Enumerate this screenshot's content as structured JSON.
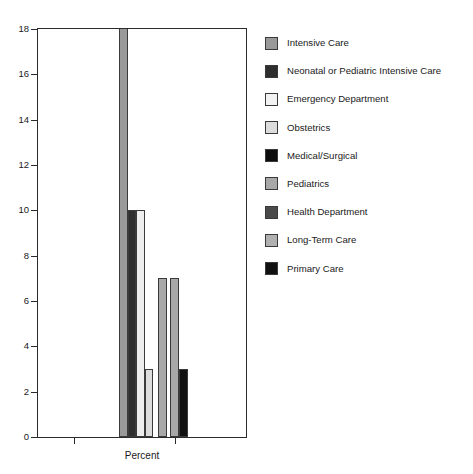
{
  "chart_data": {
    "type": "bar",
    "title": "",
    "subtitle": "",
    "xlabel": "Percent",
    "ylabel": "",
    "categories": [
      "Percent"
    ],
    "grid": false,
    "legend_position": "right",
    "ylim": [
      0,
      18
    ],
    "yticks": [
      0,
      2,
      4,
      6,
      8,
      10,
      12,
      14,
      16,
      18
    ],
    "ytick_labels": [
      "0",
      "2",
      "4",
      "6",
      "8",
      "10",
      "12",
      "14",
      "16",
      "18"
    ],
    "series": [
      {
        "name": "Intensive Care",
        "values": [
          18
        ],
        "color": "#999999"
      },
      {
        "name": "Neonatal or Pediatric Intensive Care",
        "values": [
          10
        ],
        "color": "#2e2e2e"
      },
      {
        "name": "Emergency Department",
        "values": [
          10
        ],
        "color": "#ededed"
      },
      {
        "name": "Obstetrics",
        "values": [
          3
        ],
        "color": "#dcdcdc"
      },
      {
        "name": "Medical/Surgical",
        "values": [
          0
        ],
        "color": "#0d0d0d"
      },
      {
        "name": "Pediatrics",
        "values": [
          7
        ],
        "color": "#a8a8a8"
      },
      {
        "name": "Health Department",
        "values": [
          7
        ],
        "color": "#4a4a4a"
      },
      {
        "name": "Long-Term Care",
        "values": [
          0
        ],
        "color": "#b0b0b0"
      },
      {
        "name": "Primary Care",
        "values": [
          3
        ],
        "color": "#111111"
      }
    ],
    "bars_drawn": [
      {
        "label": "Intensive Care",
        "value": 18,
        "clipped": true,
        "color": "#999999"
      },
      {
        "label": "Neonatal or Pediatric Intensive Care",
        "value": 10,
        "clipped": false,
        "color": "#2e2e2e"
      },
      {
        "label": "Emergency Department",
        "value": 10,
        "clipped": false,
        "color": "#ededed"
      },
      {
        "label": "Obstetrics",
        "value": 3,
        "clipped": false,
        "color": "#dcdcdc"
      },
      {
        "label": "Pediatrics",
        "value": 7,
        "clipped": false,
        "color": "#a8a8a8"
      },
      {
        "label": "Health Department",
        "value": 7,
        "clipped": false,
        "color": "#a8a8a8"
      },
      {
        "label": "Primary Care",
        "value": 3,
        "clipped": false,
        "color": "#111111"
      }
    ]
  },
  "axes": {
    "ytick_labels": [
      "18",
      "16",
      "14",
      "12",
      "10",
      "8",
      "6",
      "4",
      "2",
      "0"
    ],
    "xlabel": "Percent"
  },
  "legend": {
    "items": [
      {
        "label": "Intensive Care",
        "color": "#999999"
      },
      {
        "label": "Neonatal or Pediatric Intensive Care",
        "color": "#2e2e2e"
      },
      {
        "label": "Emergency Department",
        "color": "#f2f2f2"
      },
      {
        "label": "Obstetrics",
        "color": "#dcdcdc"
      },
      {
        "label": "Medical/Surgical",
        "color": "#0d0d0d"
      },
      {
        "label": "Pediatrics",
        "color": "#a8a8a8"
      },
      {
        "label": "Health Department",
        "color": "#4a4a4a"
      },
      {
        "label": "Long-Term Care",
        "color": "#b0b0b0"
      },
      {
        "label": "Primary Care",
        "color": "#111111"
      }
    ]
  }
}
